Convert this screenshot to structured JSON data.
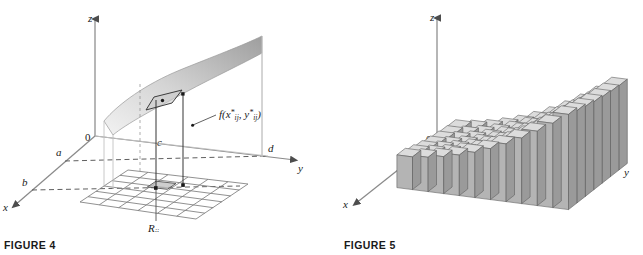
{
  "page": {
    "background_color": "#ffffff",
    "width": 643,
    "height": 255
  },
  "figure4": {
    "caption": "FIGURE 4",
    "axes": {
      "z_label": "z",
      "y_label": "y",
      "x_label": "x",
      "origin_label": "0"
    },
    "region_labels": {
      "a": "a",
      "b": "b",
      "c": "c",
      "d": "d"
    },
    "surface_label": {
      "base": "f(x",
      "full": "f(x*ij, y*ij)",
      "star": "*",
      "sub1": "ij",
      "mid": ", y",
      "sub2": "ij",
      "close": ")"
    },
    "subrectangle_label": {
      "base": "R",
      "sub": "ij"
    },
    "colors": {
      "axis": "#8a8a8a",
      "grid": "#7d7d7d",
      "surface_light": "#e8e8e8",
      "surface_dark": "#a9a9a9",
      "patch_fill": "#b9b9b9",
      "marker": "#1a1a1a",
      "text": "#1a1a1a"
    },
    "grid": {
      "rows": 6,
      "cols": 6
    }
  },
  "figure5": {
    "caption": "FIGURE 5",
    "axes": {
      "z_label": "z",
      "y_label": "y",
      "x_label": "x",
      "origin_label": "0"
    },
    "colors": {
      "axis": "#8a8a8a",
      "bar_front": "#b4b4b4",
      "bar_side": "#9a9a9a",
      "bar_top": "#dcdcdc",
      "bar_edge": "#5f5f5f",
      "text": "#1a1a1a"
    },
    "bars": {
      "cols": 11,
      "rows": 7
    }
  }
}
